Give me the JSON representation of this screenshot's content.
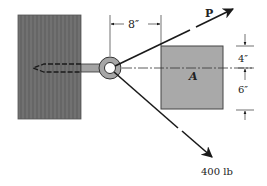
{
  "diagram": {
    "type": "statics-force-diagram",
    "labels": {
      "force_p": "P",
      "force_400": "400 lb",
      "block": "A",
      "dim_horizontal": "8″",
      "dim_upper": "4″",
      "dim_lower": "6″"
    },
    "colors": {
      "wood": "#6e6e6e",
      "block_a": "#a9a9a9",
      "line": "#1a1a1a",
      "bolt": "#9a9a9a"
    },
    "elements": {
      "wood_support": {
        "x": 18,
        "y": 15,
        "w": 63,
        "h": 104
      },
      "eye_bolt": {
        "cx": 110,
        "cy": 68,
        "outer_r": 11,
        "inner_r": 5
      },
      "block_a": {
        "x": 161,
        "y": 46,
        "w": 62,
        "h": 63
      },
      "force_p_vector": {
        "from": [
          110,
          68
        ],
        "to": [
          234,
          9
        ]
      },
      "force_400_vector": {
        "from": [
          110,
          68
        ],
        "to": [
          213,
          158
        ]
      }
    }
  }
}
